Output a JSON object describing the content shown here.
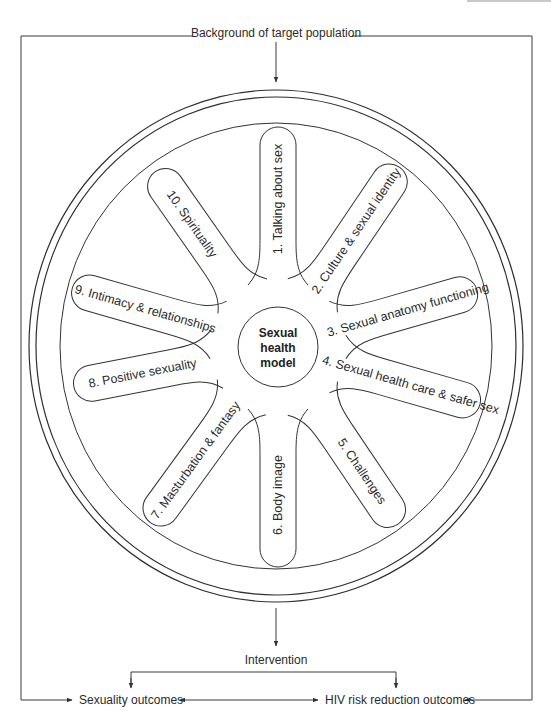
{
  "diagram": {
    "top_label": "Background of target population",
    "center": [
      "Sexual",
      "health",
      "model"
    ],
    "intervention_label": "Intervention",
    "outcomes": {
      "left": "Sexuality outcomes",
      "right": "HIV risk reduction outcomes"
    },
    "petals": [
      {
        "label": "1. Talking about sex"
      },
      {
        "label": "2. Culture & sexual identity"
      },
      {
        "label": "3. Sexual anatomy functioning"
      },
      {
        "label": "4. Sexual health care & safer sex"
      },
      {
        "label": "5. Challenges"
      },
      {
        "label": "6. Body image"
      },
      {
        "label": "7. Masturbation & fantasy"
      },
      {
        "label": "8. Positive sexuality"
      },
      {
        "label": "9. Intimacy & relationships"
      },
      {
        "label": "10. Spirituality"
      }
    ]
  },
  "colors": {
    "line": "#333333",
    "text": "#2a2a2a",
    "background": "#ffffff"
  }
}
